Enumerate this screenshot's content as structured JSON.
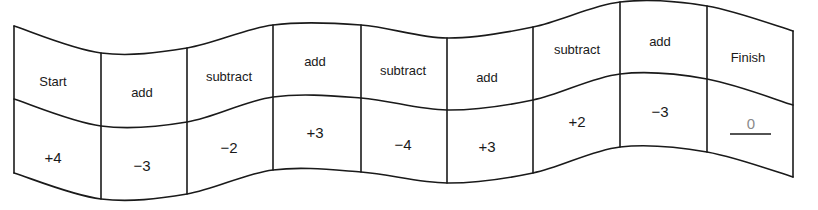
{
  "diagram": {
    "type": "wavy-strip-number-path",
    "curves": {
      "top": [
        [
          14,
          26
        ],
        [
          101,
          53
        ],
        [
          187,
          48
        ],
        [
          273,
          25
        ],
        [
          361,
          25
        ],
        [
          447,
          38
        ],
        [
          533,
          27
        ],
        [
          620,
          2
        ],
        [
          707,
          6
        ],
        [
          793,
          31
        ]
      ],
      "middle": [
        [
          14,
          99
        ],
        [
          101,
          126
        ],
        [
          187,
          122
        ],
        [
          273,
          97
        ],
        [
          361,
          98
        ],
        [
          447,
          110
        ],
        [
          533,
          100
        ],
        [
          620,
          74
        ],
        [
          707,
          79
        ],
        [
          793,
          105
        ]
      ],
      "bottom": [
        [
          14,
          173
        ],
        [
          101,
          199
        ],
        [
          187,
          194
        ],
        [
          273,
          170
        ],
        [
          361,
          172
        ],
        [
          447,
          183
        ],
        [
          533,
          173
        ],
        [
          620,
          147
        ],
        [
          707,
          152
        ],
        [
          793,
          177
        ]
      ]
    },
    "colors": {
      "line": "#1a1a1a",
      "text": "#1a1a1a",
      "answer": "#8a8a8a"
    },
    "cells": [
      {
        "operation": "Start",
        "value": "+4",
        "op_pos": [
          53,
          81
        ],
        "val_pos": [
          53,
          157
        ]
      },
      {
        "operation": "add",
        "value": "−3",
        "op_pos": [
          142,
          92
        ],
        "val_pos": [
          142,
          165
        ]
      },
      {
        "operation": "subtract",
        "value": "−2",
        "op_pos": [
          229,
          76
        ],
        "val_pos": [
          229,
          147
        ]
      },
      {
        "operation": "add",
        "value": "+3",
        "op_pos": [
          315,
          61
        ],
        "val_pos": [
          315,
          132
        ]
      },
      {
        "operation": "subtract",
        "value": "−4",
        "op_pos": [
          403,
          70
        ],
        "val_pos": [
          403,
          144
        ]
      },
      {
        "operation": "add",
        "value": "+3",
        "op_pos": [
          487,
          77
        ],
        "val_pos": [
          487,
          146
        ]
      },
      {
        "operation": "subtract",
        "value": "+2",
        "op_pos": [
          577,
          49
        ],
        "val_pos": [
          577,
          121
        ]
      },
      {
        "operation": "add",
        "value": "−3",
        "op_pos": [
          660,
          41
        ],
        "val_pos": [
          660,
          111
        ]
      },
      {
        "operation": "Finish",
        "value": "0",
        "op_pos": [
          748,
          57
        ],
        "val_pos": [
          751,
          123
        ],
        "is_answer": true,
        "underline": [
          730,
          771,
          134
        ]
      }
    ]
  }
}
